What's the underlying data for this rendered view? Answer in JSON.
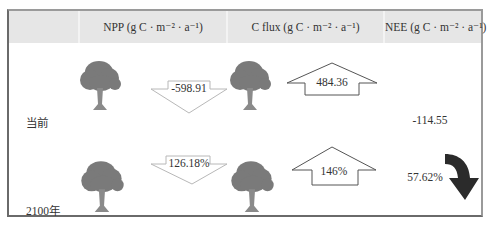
{
  "table": {
    "columns": [
      {
        "label": ""
      },
      {
        "label": "NPP (g C · m⁻² · a⁻¹)"
      },
      {
        "label": "C flux (g C · m⁻² · a⁻¹)"
      },
      {
        "label": "NEE (g C · m⁻² · a⁻¹)"
      }
    ],
    "rows": [
      {
        "label": "当前",
        "npp": "-598.91",
        "npp_arrow": "down",
        "c_flux": "484.36",
        "c_flux_arrow": "up",
        "nee": "-114.55"
      },
      {
        "label": "2100年",
        "npp": "126.18%",
        "npp_arrow": "down",
        "c_flux": "146%",
        "c_flux_arrow": "up",
        "nee": "57.62%",
        "nee_arrow": "curved-down"
      }
    ]
  },
  "colors": {
    "header_bg": "#e6e6e6",
    "tree": "#7a7a7a",
    "arrow_outline": "#b8b8b8",
    "up_arrow_outline": "#555555",
    "curved_arrow": "#2b2b2b",
    "border": "#6a6a6a"
  }
}
